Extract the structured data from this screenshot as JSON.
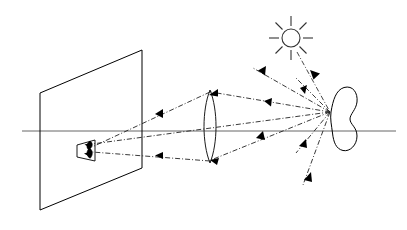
{
  "diagram": {
    "title": "Lens imaging ray diagram",
    "type": "optics-ray-diagram",
    "canvas": {
      "width": 407,
      "height": 230,
      "background": "#ffffff"
    },
    "colors": {
      "ink": "#000000",
      "ray": "#222222",
      "axis": "#555555",
      "sun": "#333333"
    },
    "elements": [
      {
        "name": "screen",
        "label": "Screen"
      },
      {
        "name": "image",
        "label": "Inverted image"
      },
      {
        "name": "lens",
        "label": "Converging lens"
      },
      {
        "name": "optical-axis",
        "label": "Optical axis"
      },
      {
        "name": "object",
        "label": "Object"
      },
      {
        "name": "sun",
        "label": "Sun"
      }
    ],
    "screen": {
      "label": "Screen",
      "points": "40,93 142,50 142,168 40,210",
      "left_x": 40,
      "right_x": 142,
      "top_left_y": 93,
      "top_right_y": 50,
      "bottom_right_y": 168,
      "bottom_left_y": 210
    },
    "image_marker": {
      "label": "Inverted image on screen",
      "plate_points": "77,145 95,140 95,161 77,157",
      "blob_path": "M 90,141 C 93,143 92,147 90,148 C 92,150 93,155 90,158 C 87,157 86,152 88,149 C 86,147 87,143 90,141 Z"
    },
    "lens": {
      "label": "Converging lens",
      "center_x": 210,
      "top_y": 90,
      "bottom_y": 163,
      "bulge": 7,
      "path": "M 210,90 C 217,110 217,143 210,163 C 203,143 203,110 210,90 Z"
    },
    "optical_axis": {
      "label": "Optical axis",
      "y": 131,
      "x_start": 22,
      "x_end": 396
    },
    "object": {
      "label": "Object",
      "focus_point": {
        "x": 331,
        "y": 113
      },
      "path": "M 331,112 C 334,101 336,91 343,88 C 352,85 357,93 356,102 C 355,110 349,114 349,119 C 349,124 356,127 356,135 C 356,144 350,151 343,150 C 336,149 333,142 332,133 C 331,126 330,119 331,112 Z"
    },
    "sun": {
      "label": "Sun",
      "center": {
        "x": 291,
        "y": 38
      },
      "radius": 9,
      "ray_inner": 12,
      "ray_outer": 22,
      "ray_count": 8
    },
    "rays": {
      "imaging": [
        {
          "name": "upper-ray-object-to-lens",
          "from": "object",
          "to": "lens-top"
        },
        {
          "name": "upper-ray-lens-to-image",
          "from": "lens-top",
          "to": "image"
        },
        {
          "name": "lower-ray-object-to-lens",
          "from": "object",
          "to": "lens-bottom"
        },
        {
          "name": "lower-ray-lens-to-image",
          "from": "lens-bottom",
          "to": "image"
        },
        {
          "name": "center-ray-object-to-image",
          "from": "object",
          "to": "image"
        }
      ],
      "scattered": [
        {
          "name": "scatter-ray-upper-left"
        },
        {
          "name": "scatter-ray-upper"
        },
        {
          "name": "scatter-ray-to-sun"
        },
        {
          "name": "scatter-ray-lower"
        },
        {
          "name": "scatter-ray-lower-far"
        }
      ],
      "sun_incident": [
        {
          "name": "sun-incident-ray"
        }
      ]
    }
  }
}
